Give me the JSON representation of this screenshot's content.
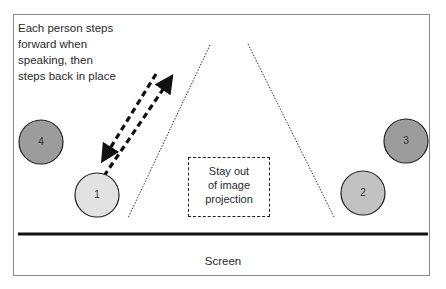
{
  "diagram": {
    "note": "Each person steps forward when speaking, then steps back in place",
    "note_lines": [
      "Each person steps",
      "forward when",
      "speaking, then",
      "steps back in place"
    ],
    "zone_label_lines": [
      "Stay out",
      "of image",
      "projection"
    ],
    "screen_label": "Screen",
    "people": [
      {
        "id": "1",
        "label": "1",
        "cx": 97,
        "cy": 195,
        "r": 22,
        "fill": "#e2e2e2"
      },
      {
        "id": "2",
        "label": "2",
        "cx": 363,
        "cy": 193,
        "r": 22,
        "fill": "#c2c2c2"
      },
      {
        "id": "3",
        "label": "3",
        "cx": 406,
        "cy": 141,
        "r": 22,
        "fill": "#9c9c9c"
      },
      {
        "id": "4",
        "label": "4",
        "cx": 41,
        "cy": 142,
        "r": 22,
        "fill": "#9c9c9c"
      }
    ],
    "colors": {
      "frame": "#8a8a8a",
      "screen_line": "#111111",
      "arrow": "#111111",
      "projection_lines": "#333333"
    }
  }
}
